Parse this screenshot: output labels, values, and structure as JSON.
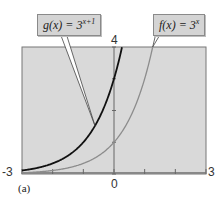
{
  "chart_data": {
    "type": "line",
    "title": "",
    "xlabel": "",
    "ylabel": "",
    "xlim": [
      -3,
      3
    ],
    "ylim": [
      0,
      4
    ],
    "x_tick_labels": [
      "-3",
      "0",
      "3"
    ],
    "y_tick_labels": [
      "4"
    ],
    "x_ticks": [
      -3,
      -2,
      -1,
      0,
      1,
      2,
      3
    ],
    "y_ticks": [
      0,
      1,
      2,
      3,
      4
    ],
    "grid": false,
    "panel_label": "(a)",
    "series": [
      {
        "name": "g(x) = 3^(x+1)",
        "label_text": "g(x) = 3",
        "label_exp": "x+1",
        "color": "#111111",
        "x": [
          -3,
          -2.5,
          -2,
          -1.5,
          -1,
          -0.5,
          0,
          0.26
        ],
        "y": [
          0.111,
          0.192,
          0.333,
          0.577,
          1.0,
          1.732,
          3.0,
          3.99
        ]
      },
      {
        "name": "f(x) = 3^x",
        "label_text": "f(x) = 3",
        "label_exp": "x",
        "color": "#8c8c8c",
        "x": [
          -3,
          -2,
          -1,
          0,
          0.5,
          1,
          1.26
        ],
        "y": [
          0.037,
          0.111,
          0.333,
          1.0,
          1.732,
          3.0,
          3.99
        ]
      }
    ],
    "annotations": [
      {
        "text": "g(x) = 3^(x+1)",
        "type": "callout",
        "points_to": [
          -0.6,
          1.5
        ]
      },
      {
        "text": "f(x) = 3^x",
        "type": "callout",
        "points_to": [
          1.26,
          4
        ]
      }
    ]
  }
}
